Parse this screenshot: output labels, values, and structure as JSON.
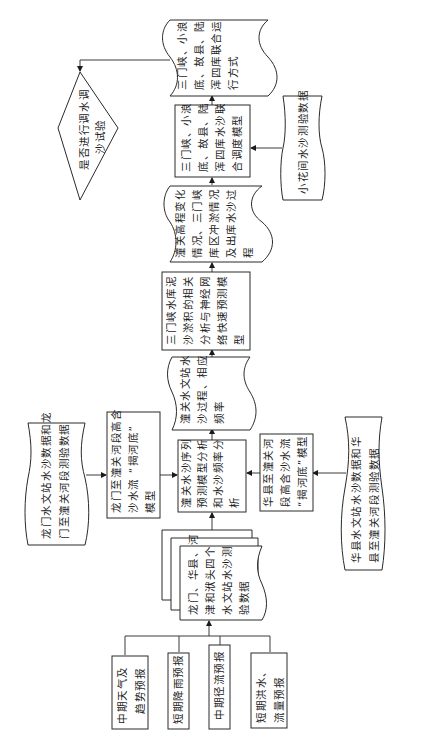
{
  "diagram": {
    "orientation": "rotated-90-ccw",
    "colors": {
      "stroke": "#2a2a2a",
      "text": "#1e1e1e",
      "background": "#ffffff"
    },
    "nodes": {
      "decision": {
        "type": "diamond",
        "lines": [
          "是否进行调水调",
          "沙试验"
        ]
      },
      "joint_operation": {
        "type": "document",
        "lines": [
          "三门峡、小浪",
          "底、故县、陆",
          "浑四库联合运",
          "行方式"
        ]
      },
      "joint_model": {
        "type": "process",
        "lines": [
          "三门峡、小浪",
          "底、故县、陆",
          "浑四库水沙联",
          "合调度模型"
        ]
      },
      "xiaohua_data": {
        "type": "document",
        "lines": [
          "小花间水沙测验数据"
        ]
      },
      "tongguan_elevation": {
        "type": "document",
        "lines": [
          "潼关高程变化",
          "情况、三门峡",
          "库区冲淤情况",
          "及出库水沙过",
          "程"
        ]
      },
      "sanmenxia_model": {
        "type": "process",
        "lines": [
          "三门峡水库泥",
          "沙淤积的相关",
          "分析与神经网",
          "络快速预测模",
          "型"
        ]
      },
      "tongguan_process": {
        "type": "document",
        "lines": [
          "潼关水文站水",
          "沙过程、相应",
          "频率"
        ]
      },
      "tongguan_series": {
        "type": "process",
        "lines": [
          "潼关水沙序列",
          "预测模型分析",
          "和水沙频率分",
          "析"
        ]
      },
      "huaxian_model": {
        "type": "process",
        "lines": [
          "华县至潼关河",
          "段高含沙水流",
          "“揭河底”模型"
        ]
      },
      "huaxian_data": {
        "type": "document",
        "lines": [
          "华县水文站水沙数据和华",
          "县至潼关河段测验数据"
        ]
      },
      "longmen_model": {
        "type": "process",
        "lines": [
          "龙门至潼关河段高含",
          "沙水流 “揭河底”",
          "模型"
        ]
      },
      "longmen_data": {
        "type": "document",
        "lines": [
          "龙门水文站水沙数据和龙",
          "门至潼关河段测验数据"
        ]
      },
      "four_station_data": {
        "type": "multi-document",
        "lines": [
          "龙门、华县、河",
          "津和洑头四个",
          "水文站水沙测",
          "验数据"
        ]
      },
      "forecast_weather": {
        "type": "process",
        "lines": [
          "中期天气及",
          "趋势预报"
        ]
      },
      "forecast_rain": {
        "type": "process",
        "lines": [
          "短期降雨预报"
        ]
      },
      "forecast_runoff": {
        "type": "process",
        "lines": [
          "中期径流预报"
        ]
      },
      "forecast_flood": {
        "type": "process",
        "lines": [
          "短期洪水、",
          "流量预报"
        ]
      }
    },
    "edges": [
      [
        "forecast_weather",
        "four_station_data"
      ],
      [
        "forecast_rain",
        "four_station_data"
      ],
      [
        "forecast_runoff",
        "four_station_data"
      ],
      [
        "forecast_flood",
        "four_station_data"
      ],
      [
        "four_station_data",
        "tongguan_series"
      ],
      [
        "longmen_data",
        "longmen_model"
      ],
      [
        "longmen_model",
        "tongguan_series"
      ],
      [
        "huaxian_data",
        "huaxian_model"
      ],
      [
        "huaxian_model",
        "tongguan_series"
      ],
      [
        "tongguan_series",
        "tongguan_process"
      ],
      [
        "tongguan_process",
        "sanmenxia_model"
      ],
      [
        "sanmenxia_model",
        "tongguan_elevation"
      ],
      [
        "tongguan_elevation",
        "joint_model"
      ],
      [
        "xiaohua_data",
        "joint_model"
      ],
      [
        "joint_model",
        "joint_operation"
      ],
      [
        "joint_operation",
        "decision"
      ]
    ]
  }
}
